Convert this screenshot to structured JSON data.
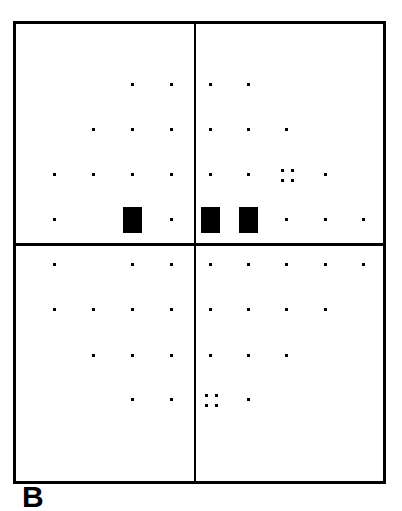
{
  "figure": {
    "label": "B",
    "quadrants": [
      "upper-left",
      "upper-right",
      "lower-left",
      "lower-right"
    ],
    "colors": {
      "ink": "#000000",
      "background": "#ffffff"
    }
  },
  "grid": {
    "columns_x": [
      54,
      93,
      132,
      171,
      210,
      248,
      286,
      325,
      363
    ],
    "rows_y": [
      84,
      129,
      174,
      219,
      264,
      309,
      355,
      399
    ],
    "points": [
      {
        "r": 0,
        "c": 2,
        "type": "dot"
      },
      {
        "r": 0,
        "c": 3,
        "type": "dot"
      },
      {
        "r": 0,
        "c": 4,
        "type": "dot"
      },
      {
        "r": 0,
        "c": 5,
        "type": "dot"
      },
      {
        "r": 1,
        "c": 1,
        "type": "dot"
      },
      {
        "r": 1,
        "c": 2,
        "type": "dot"
      },
      {
        "r": 1,
        "c": 3,
        "type": "dot"
      },
      {
        "r": 1,
        "c": 4,
        "type": "dot"
      },
      {
        "r": 1,
        "c": 5,
        "type": "dot"
      },
      {
        "r": 1,
        "c": 6,
        "type": "dot"
      },
      {
        "r": 2,
        "c": 0,
        "type": "dot"
      },
      {
        "r": 2,
        "c": 1,
        "type": "dot"
      },
      {
        "r": 2,
        "c": 2,
        "type": "dot"
      },
      {
        "r": 2,
        "c": 3,
        "type": "dot"
      },
      {
        "r": 2,
        "c": 4,
        "type": "dot"
      },
      {
        "r": 2,
        "c": 5,
        "type": "dot"
      },
      {
        "r": 2,
        "c": 6,
        "type": "cluster"
      },
      {
        "r": 2,
        "c": 7,
        "type": "dot"
      },
      {
        "r": 3,
        "c": 0,
        "type": "dot"
      },
      {
        "r": 3,
        "c": 2,
        "type": "block"
      },
      {
        "r": 3,
        "c": 3,
        "type": "dot"
      },
      {
        "r": 3,
        "c": 4,
        "type": "block"
      },
      {
        "r": 3,
        "c": 5,
        "type": "block"
      },
      {
        "r": 3,
        "c": 6,
        "type": "dot"
      },
      {
        "r": 3,
        "c": 7,
        "type": "dot"
      },
      {
        "r": 3,
        "c": 8,
        "type": "dot"
      },
      {
        "r": 4,
        "c": 0,
        "type": "dot"
      },
      {
        "r": 4,
        "c": 2,
        "type": "dot"
      },
      {
        "r": 4,
        "c": 3,
        "type": "dot"
      },
      {
        "r": 4,
        "c": 4,
        "type": "dot"
      },
      {
        "r": 4,
        "c": 5,
        "type": "dot"
      },
      {
        "r": 4,
        "c": 6,
        "type": "dot"
      },
      {
        "r": 4,
        "c": 7,
        "type": "dot"
      },
      {
        "r": 4,
        "c": 8,
        "type": "dot"
      },
      {
        "r": 5,
        "c": 0,
        "type": "dot"
      },
      {
        "r": 5,
        "c": 1,
        "type": "dot"
      },
      {
        "r": 5,
        "c": 2,
        "type": "dot"
      },
      {
        "r": 5,
        "c": 3,
        "type": "dot"
      },
      {
        "r": 5,
        "c": 4,
        "type": "dot"
      },
      {
        "r": 5,
        "c": 5,
        "type": "dot"
      },
      {
        "r": 5,
        "c": 6,
        "type": "dot"
      },
      {
        "r": 5,
        "c": 7,
        "type": "dot"
      },
      {
        "r": 6,
        "c": 1,
        "type": "dot"
      },
      {
        "r": 6,
        "c": 2,
        "type": "dot"
      },
      {
        "r": 6,
        "c": 3,
        "type": "dot"
      },
      {
        "r": 6,
        "c": 4,
        "type": "dot"
      },
      {
        "r": 6,
        "c": 5,
        "type": "dot"
      },
      {
        "r": 6,
        "c": 6,
        "type": "dot"
      },
      {
        "r": 7,
        "c": 2,
        "type": "dot"
      },
      {
        "r": 7,
        "c": 3,
        "type": "dot"
      },
      {
        "r": 7,
        "c": 4,
        "type": "cluster"
      },
      {
        "r": 7,
        "c": 5,
        "type": "dot"
      }
    ]
  }
}
